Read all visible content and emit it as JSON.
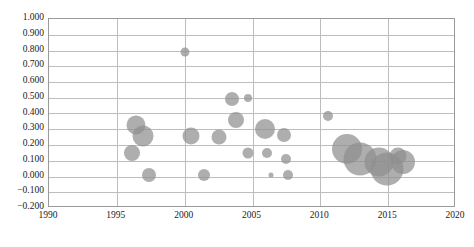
{
  "chart_data": {
    "type": "scatter",
    "title": "",
    "subtitle": "",
    "xlabel": "",
    "ylabel": "",
    "xlim": [
      1990,
      2020
    ],
    "ylim": [
      -0.2,
      1.0
    ],
    "xticks": [
      "1990",
      "1995",
      "2000",
      "2005",
      "2010",
      "2015",
      "2020"
    ],
    "xtick_values": [
      1990,
      1995,
      2000,
      2005,
      2010,
      2015,
      2020
    ],
    "yticks": [
      "1.000",
      "0.900",
      "0.800",
      "0.700",
      "0.600",
      "0.500",
      "0.400",
      "0.300",
      "0.200",
      "0.100",
      "0.000",
      "-0.100",
      "-0.200"
    ],
    "ytick_values": [
      1.0,
      0.9,
      0.8,
      0.7,
      0.6,
      0.5,
      0.4,
      0.3,
      0.2,
      0.1,
      0.0,
      -0.1,
      -0.2
    ],
    "grid": true,
    "legend": null,
    "legend_position": "none",
    "marker_color": "#8f8f8f",
    "marker_opacity": 0.72,
    "points": [
      {
        "x": 1996.4,
        "y": 0.325,
        "size": 19
      },
      {
        "x": 1996.9,
        "y": 0.258,
        "size": 21
      },
      {
        "x": 1996.1,
        "y": 0.15,
        "size": 16
      },
      {
        "x": 1997.4,
        "y": 0.01,
        "size": 14
      },
      {
        "x": 2000.0,
        "y": 0.79,
        "size": 9
      },
      {
        "x": 2000.5,
        "y": 0.26,
        "size": 17
      },
      {
        "x": 2001.4,
        "y": 0.01,
        "size": 12
      },
      {
        "x": 2002.5,
        "y": 0.252,
        "size": 15
      },
      {
        "x": 2003.5,
        "y": 0.49,
        "size": 14
      },
      {
        "x": 2003.8,
        "y": 0.36,
        "size": 16
      },
      {
        "x": 2004.7,
        "y": 0.5,
        "size": 8
      },
      {
        "x": 2004.7,
        "y": 0.148,
        "size": 11
      },
      {
        "x": 2005.9,
        "y": 0.3,
        "size": 20
      },
      {
        "x": 2006.1,
        "y": 0.152,
        "size": 10
      },
      {
        "x": 2006.4,
        "y": 0.007,
        "size": 5
      },
      {
        "x": 2007.3,
        "y": 0.262,
        "size": 14
      },
      {
        "x": 2007.5,
        "y": 0.108,
        "size": 10
      },
      {
        "x": 2007.6,
        "y": 0.008,
        "size": 10
      },
      {
        "x": 2010.6,
        "y": 0.385,
        "size": 10
      },
      {
        "x": 2012.0,
        "y": 0.172,
        "size": 30
      },
      {
        "x": 2012.9,
        "y": 0.11,
        "size": 33
      },
      {
        "x": 2014.3,
        "y": 0.095,
        "size": 29
      },
      {
        "x": 2014.9,
        "y": 0.05,
        "size": 33
      },
      {
        "x": 2015.7,
        "y": 0.128,
        "size": 17
      },
      {
        "x": 2016.1,
        "y": 0.09,
        "size": 24
      }
    ]
  }
}
